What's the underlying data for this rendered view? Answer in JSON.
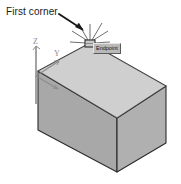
{
  "figure": {
    "title_annotation": "First corner",
    "snap_tooltip": "Endpoint",
    "ucs_axes": {
      "z": "Z",
      "y": "Y",
      "x": "X"
    },
    "icons": {
      "pointer_arrow": "arrow-pointer-icon",
      "crosshair_cursor": "crosshair-cursor-icon",
      "snap_marker": "endpoint-snap-marker-icon",
      "ucs": "ucs-axis-icon",
      "box": "3d-box-solid"
    },
    "colors": {
      "top_face": "#d0d0d0",
      "left_face": "#a8a8a8",
      "right_face": "#b4b4b4",
      "outline": "#2b2b2b",
      "tooltip_bg": "#b9b9b9",
      "tooltip_text": "#141414",
      "annotation_text": "#1a1a1a",
      "ucs_line": "#8d8d8d",
      "background": "#ffffff"
    },
    "geometry": {
      "top_apex": [
        90,
        43
      ],
      "top_left": [
        38,
        71
      ],
      "top_right": [
        166,
        86
      ],
      "top_front": [
        117,
        118
      ],
      "bottom_left": [
        38,
        130
      ],
      "bottom_front": [
        117,
        172
      ],
      "bottom_right": [
        166,
        143
      ]
    }
  }
}
